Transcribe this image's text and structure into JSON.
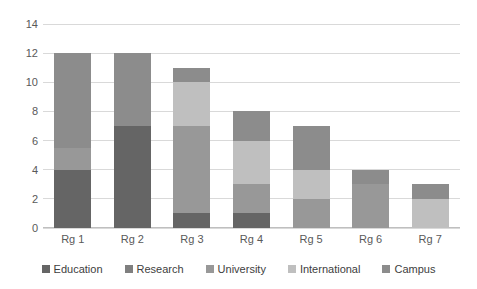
{
  "chart_data": {
    "type": "bar",
    "stacked": true,
    "title": "",
    "xlabel": "",
    "ylabel": "",
    "ylim": [
      0,
      14
    ],
    "ytick_step": 2,
    "yticks": [
      "14",
      "12",
      "10",
      "8",
      "6",
      "4",
      "2",
      "0"
    ],
    "categories": [
      "Rg 1",
      "Rg 2",
      "Rg 3",
      "Rg 4",
      "Rg 5",
      "Rg 6",
      "Rg 7"
    ],
    "grid": true,
    "legend_position": "bottom",
    "series": [
      {
        "name": "Education",
        "color": "#656565",
        "values": [
          4,
          7,
          1,
          1,
          0,
          0,
          0
        ]
      },
      {
        "name": "Research",
        "color": "#7f7f7f",
        "values": [
          0,
          0,
          0,
          0,
          0,
          0,
          0
        ]
      },
      {
        "name": "University",
        "color": "#989898",
        "values": [
          1.5,
          0,
          6,
          2,
          2,
          3,
          0
        ]
      },
      {
        "name": "International",
        "color": "#bfbfbf",
        "values": [
          0,
          0,
          3,
          3,
          2,
          0,
          2
        ]
      },
      {
        "name": "Campus",
        "color": "#8c8c8c",
        "values": [
          6.5,
          5,
          1,
          2,
          3,
          1,
          1
        ]
      }
    ],
    "totals": [
      12,
      12,
      11,
      8,
      7,
      4,
      3
    ]
  },
  "legend": {
    "items": [
      {
        "label": "Education",
        "color": "#656565"
      },
      {
        "label": "Research",
        "color": "#7f7f7f"
      },
      {
        "label": "University",
        "color": "#989898"
      },
      {
        "label": "International",
        "color": "#bfbfbf"
      },
      {
        "label": "Campus",
        "color": "#8c8c8c"
      }
    ]
  },
  "style": {
    "gridline_color": "#d9d9d9",
    "axis_color": "#bfbfbf",
    "tick_text_color": "#595959",
    "legend_text_color": "#404040",
    "background": "#ffffff"
  }
}
